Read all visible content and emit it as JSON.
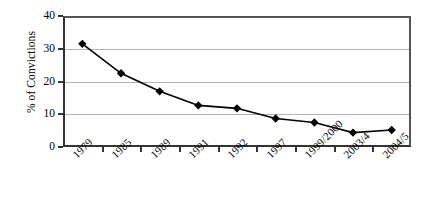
{
  "chart_data": {
    "type": "line",
    "title": "",
    "xlabel": "",
    "ylabel": "% of Convictions",
    "categories": [
      "1979",
      "1985",
      "1989",
      "1991",
      "1992",
      "1997",
      "1999/2000",
      "2003/4",
      "2004/5"
    ],
    "values": [
      31.5,
      22.5,
      17.0,
      12.7,
      11.8,
      8.7,
      7.5,
      4.4,
      5.2
    ],
    "series": [
      {
        "name": "% of Convictions",
        "values": [
          31.5,
          22.5,
          17.0,
          12.7,
          11.8,
          8.7,
          7.5,
          4.4,
          5.2
        ]
      }
    ],
    "ylim": [
      0,
      40
    ],
    "yticks": [
      0,
      10,
      20,
      30,
      40
    ],
    "ytick_labels": [
      "0",
      "10",
      "20",
      "30",
      "40"
    ],
    "grid": "horizontal",
    "legend": "none",
    "marker": "diamond",
    "marker_color": "#000000",
    "line_color": "#000000",
    "gridline_color": "#b3b3b3",
    "axis_color": "#333333",
    "background": "#ffffff"
  }
}
